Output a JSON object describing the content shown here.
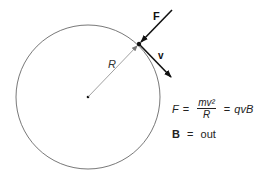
{
  "diagram": {
    "circle": {
      "cx": 88,
      "cy": 97,
      "r": 72,
      "stroke": "#555555"
    },
    "center_dot": {
      "x": 88,
      "y": 97
    },
    "particle": {
      "x": 139,
      "y": 44
    },
    "labels": {
      "force": "F",
      "velocity": "v",
      "radius": "R"
    },
    "equation": {
      "lhs": "F",
      "eq1": "=",
      "numerator": "mv²",
      "denominator": "R",
      "eq2": "=",
      "rhs": "qvB"
    },
    "field": {
      "symbol": "B",
      "eq": "=",
      "value": "out"
    },
    "colors": {
      "ink": "#111111",
      "thin": "#555555"
    }
  }
}
